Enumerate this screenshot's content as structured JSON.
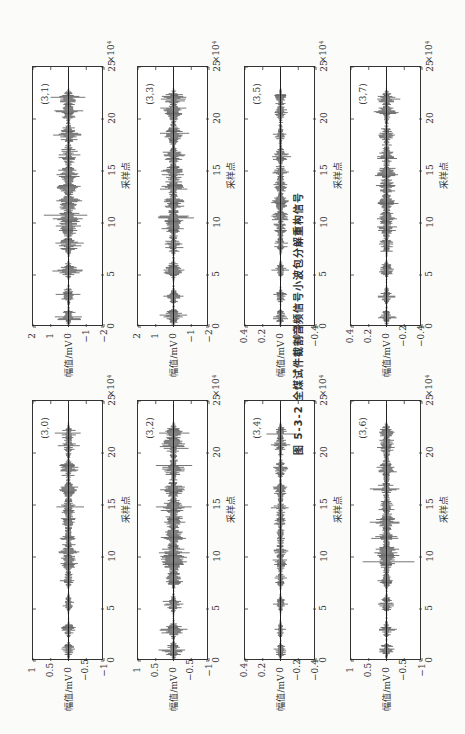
{
  "figure": {
    "caption": "图 5-3-2  全煤试件截割音频信号小波包分解重构信号",
    "orientation": "rotated 90° counter-clockwise",
    "xlabel": "采样点",
    "ylabel": "幅值/mV",
    "x_exponent_label": "×10⁴"
  },
  "chart_data": [
    {
      "type": "line",
      "title": "(3,1)",
      "xlabel": "采样点",
      "ylabel": "幅值/mV",
      "xlim": [
        0,
        25
      ],
      "x_scale": "×10^4",
      "ylim": [
        -2,
        2
      ],
      "xticks": [
        0,
        5,
        10,
        15,
        20,
        25
      ],
      "yticks": [
        -2,
        -1,
        0,
        1,
        2
      ],
      "description": "wavelet packet reconstructed signal node (3,1); bursty noise around 0, peak amplitude ~1.8 near x≈20.7"
    },
    {
      "type": "line",
      "title": "(3,3)",
      "xlabel": "采样点",
      "ylabel": "幅值/mV",
      "xlim": [
        0,
        25
      ],
      "x_scale": "×10^4",
      "ylim": [
        -2,
        2
      ],
      "xticks": [
        0,
        5,
        10,
        15,
        20,
        25
      ],
      "yticks": [
        -2,
        -1,
        0,
        1,
        2
      ],
      "description": "node (3,3); peak amplitude ~1.8 near x≈20.7"
    },
    {
      "type": "line",
      "title": "(3,5)",
      "xlabel": "采样点",
      "ylabel": "幅值/mV",
      "xlim": [
        0,
        25
      ],
      "x_scale": "×10^4",
      "ylim": [
        -0.4,
        0.4
      ],
      "xticks": [
        0,
        5,
        10,
        15,
        20,
        25
      ],
      "yticks": [
        -0.4,
        -0.2,
        0,
        0.2,
        0.4
      ],
      "description": "node (3,5); sparse spikes, max ~0.25"
    },
    {
      "type": "line",
      "title": "(3,7)",
      "xlabel": "采样点",
      "ylabel": "幅值/mV",
      "xlim": [
        0,
        25
      ],
      "x_scale": "×10^4",
      "ylim": [
        -0.4,
        0.4
      ],
      "xticks": [
        0,
        5,
        10,
        15,
        20,
        25
      ],
      "yticks": [
        -0.4,
        -0.2,
        0,
        0.2,
        0.4
      ],
      "description": "node (3,7); bursty, max ~0.3"
    },
    {
      "type": "line",
      "title": "(3,0)",
      "xlabel": "采样点",
      "ylabel": "幅值/mV",
      "xlim": [
        0,
        25
      ],
      "x_scale": "×10^4",
      "ylim": [
        -1,
        1
      ],
      "xticks": [
        0,
        5,
        10,
        15,
        20,
        25
      ],
      "yticks": [
        -1,
        -0.5,
        0,
        0.5,
        1
      ],
      "description": "node (3,0); low amplitude bursts, max ~0.7 near x≈20.7"
    },
    {
      "type": "line",
      "title": "(3,2)",
      "xlabel": "采样点",
      "ylabel": "幅值/mV",
      "xlim": [
        0,
        25
      ],
      "x_scale": "×10^4",
      "ylim": [
        -1,
        1
      ],
      "xticks": [
        0,
        5,
        10,
        15,
        20,
        25
      ],
      "yticks": [
        -1,
        -0.5,
        0,
        0.5,
        1
      ],
      "description": "node (3,2); dense bursts, max ~0.7"
    },
    {
      "type": "line",
      "title": "(3,4)",
      "xlabel": "采样点",
      "ylabel": "幅值/mV",
      "xlim": [
        0,
        25
      ],
      "x_scale": "×10^4",
      "ylim": [
        -0.4,
        0.4
      ],
      "xticks": [
        0,
        5,
        10,
        15,
        20,
        25
      ],
      "yticks": [
        -0.4,
        -0.2,
        0,
        0.2,
        0.4
      ],
      "description": "node (3,4); sparse spikes, largest ~0.3 near x≈12"
    },
    {
      "type": "line",
      "title": "(3,6)",
      "xlabel": "采样点",
      "ylabel": "幅值/mV",
      "xlim": [
        0,
        25
      ],
      "x_scale": "×10^4",
      "ylim": [
        -1,
        1
      ],
      "xticks": [
        0,
        5,
        10,
        15,
        20,
        25
      ],
      "yticks": [
        -1,
        -0.5,
        0,
        0.5,
        1
      ],
      "description": "node (3,6); bursts, max ~0.6"
    }
  ],
  "panels": [
    {
      "label": "(3,1)",
      "yticks": [
        "2",
        "1",
        "0",
        "−1",
        "−2"
      ],
      "xticks": [
        "0",
        "5",
        "10",
        "15",
        "20",
        "25"
      ],
      "col": 0,
      "row": 0,
      "amp": 0.42,
      "seed": 11
    },
    {
      "label": "(3,3)",
      "yticks": [
        "2",
        "1",
        "0",
        "−1",
        "−2"
      ],
      "xticks": [
        "0",
        "5",
        "10",
        "15",
        "20",
        "25"
      ],
      "col": 1,
      "row": 0,
      "amp": 0.42,
      "seed": 33
    },
    {
      "label": "(3,5)",
      "yticks": [
        "0.4",
        "0.2",
        "0",
        "−0.2",
        "−0.4"
      ],
      "xticks": [
        "0",
        "5",
        "10",
        "15",
        "20",
        "25"
      ],
      "col": 2,
      "row": 0,
      "amp": 0.25,
      "seed": 55
    },
    {
      "label": "(3,7)",
      "yticks": [
        "0.4",
        "0.2",
        "0",
        "−0.2",
        "−0.4"
      ],
      "xticks": [
        "0",
        "5",
        "10",
        "15",
        "20",
        "25"
      ],
      "col": 3,
      "row": 0,
      "amp": 0.32,
      "seed": 77
    },
    {
      "label": "(3,0)",
      "yticks": [
        "1",
        "0.5",
        "0",
        "−0.5",
        "−1"
      ],
      "xticks": [
        "0",
        "5",
        "10",
        "15",
        "20",
        "25"
      ],
      "col": 0,
      "row": 1,
      "amp": 0.3,
      "seed": 10
    },
    {
      "label": "(3,2)",
      "yticks": [
        "1",
        "0.5",
        "0",
        "−0.5",
        "−1"
      ],
      "xticks": [
        "0",
        "5",
        "10",
        "15",
        "20",
        "25"
      ],
      "col": 1,
      "row": 1,
      "amp": 0.45,
      "seed": 22
    },
    {
      "label": "(3,4)",
      "yticks": [
        "0.4",
        "0.2",
        "0",
        "−0.2",
        "−0.4"
      ],
      "xticks": [
        "0",
        "5",
        "10",
        "15",
        "20",
        "25"
      ],
      "col": 2,
      "row": 1,
      "amp": 0.25,
      "seed": 44
    },
    {
      "label": "(3,6)",
      "yticks": [
        "1",
        "0.5",
        "0",
        "−0.5",
        "−1"
      ],
      "xticks": [
        "0",
        "5",
        "10",
        "15",
        "20",
        "25"
      ],
      "col": 3,
      "row": 1,
      "amp": 0.35,
      "seed": 66
    }
  ]
}
